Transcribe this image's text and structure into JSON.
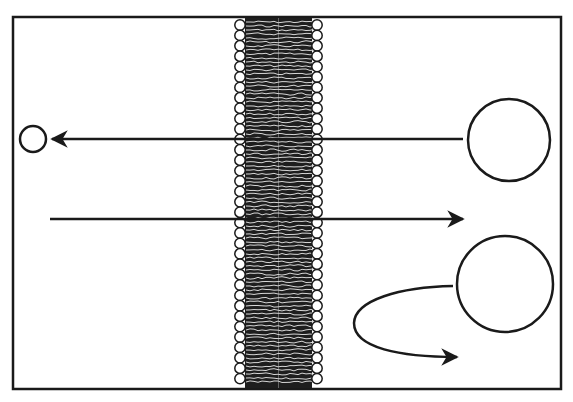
{
  "diagram": {
    "type": "membrane-transport",
    "colors": {
      "stroke": "#1a1a1a",
      "membrane_core": "#1e1e1e",
      "background": "#ffffff"
    },
    "elements": [
      {
        "id": "frame",
        "kind": "rect"
      },
      {
        "id": "bilayer",
        "kind": "lipid-bilayer"
      },
      {
        "id": "large-molecule-top",
        "kind": "circle",
        "arrow": "left-through-membrane"
      },
      {
        "id": "small-molecule-left",
        "kind": "circle"
      },
      {
        "id": "arrow-right",
        "kind": "arrow",
        "direction": "right"
      },
      {
        "id": "large-molecule-bottom",
        "kind": "circle",
        "arrow": "repelled-loop"
      }
    ]
  }
}
